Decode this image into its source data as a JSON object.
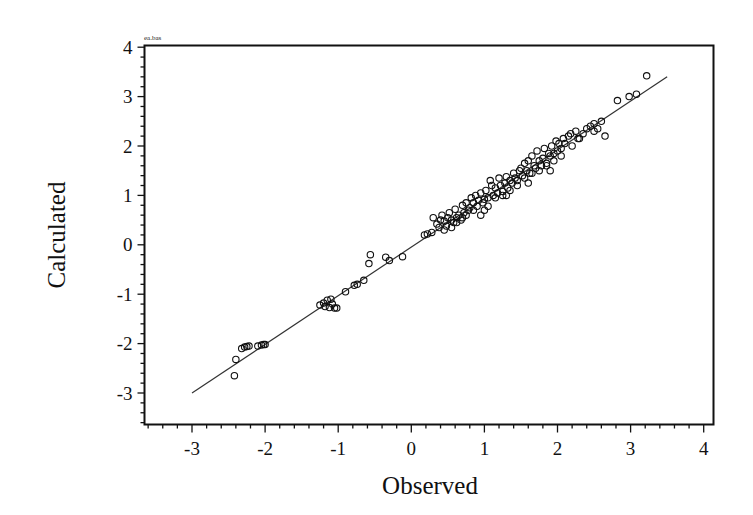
{
  "chart_data": {
    "type": "scatter",
    "title": "ea.bas",
    "xlabel": "Observed",
    "ylabel": "Calculated",
    "xlim": [
      -3.65,
      4.15
    ],
    "ylim": [
      -3.65,
      4.05
    ],
    "xticks": [
      -3,
      -2,
      -1,
      0,
      1,
      2,
      3,
      4
    ],
    "yticks": [
      -3,
      -2,
      -1,
      0,
      1,
      2,
      3,
      4
    ],
    "grid": false,
    "legend": null,
    "fit_line": {
      "x": [
        -3.0,
        3.5
      ],
      "y": [
        -3.0,
        3.4
      ]
    },
    "series": [
      {
        "name": "points",
        "marker": "open-circle",
        "x": [
          -2.42,
          -2.4,
          -2.32,
          -2.28,
          -2.25,
          -2.22,
          -2.1,
          -2.05,
          -2.02,
          -2.0,
          -1.25,
          -1.2,
          -1.18,
          -1.15,
          -1.12,
          -1.1,
          -1.08,
          -1.05,
          -1.02,
          -0.9,
          -0.78,
          -0.74,
          -0.65,
          -0.58,
          -0.56,
          -0.35,
          -0.3,
          -0.12,
          0.18,
          0.22,
          0.28,
          0.3,
          0.35,
          0.38,
          0.4,
          0.42,
          0.45,
          0.48,
          0.5,
          0.52,
          0.55,
          0.58,
          0.6,
          0.62,
          0.65,
          0.68,
          0.7,
          0.72,
          0.75,
          0.78,
          0.8,
          0.82,
          0.85,
          0.88,
          0.9,
          0.92,
          0.95,
          0.98,
          1.0,
          1.02,
          1.05,
          1.08,
          1.1,
          1.12,
          1.15,
          1.18,
          1.2,
          1.22,
          1.25,
          1.28,
          1.3,
          1.32,
          1.35,
          1.38,
          1.4,
          1.42,
          1.45,
          1.48,
          1.5,
          1.52,
          1.55,
          1.58,
          1.6,
          1.62,
          1.65,
          1.68,
          1.7,
          1.72,
          1.75,
          1.78,
          1.8,
          1.82,
          1.85,
          1.88,
          1.9,
          1.92,
          1.95,
          1.98,
          2.0,
          2.02,
          2.05,
          2.08,
          2.1,
          2.15,
          2.2,
          2.25,
          2.3,
          2.35,
          2.4,
          2.45,
          2.5,
          2.55,
          2.6,
          2.65,
          2.82,
          2.98,
          3.08,
          3.22,
          0.55,
          0.62,
          0.7,
          0.85,
          0.95,
          1.05,
          1.15,
          1.25,
          1.35,
          1.45,
          1.55,
          1.65,
          1.75,
          1.85,
          1.95,
          2.05,
          2.18,
          0.45,
          0.75,
          1.0,
          1.3,
          1.6,
          1.9,
          2.28,
          2.5
        ],
        "y": [
          -2.65,
          -2.32,
          -2.1,
          -2.07,
          -2.06,
          -2.05,
          -2.05,
          -2.03,
          -2.02,
          -2.02,
          -1.22,
          -1.18,
          -1.25,
          -1.12,
          -1.27,
          -1.1,
          -1.2,
          -1.28,
          -1.28,
          -0.95,
          -0.82,
          -0.8,
          -0.72,
          -0.38,
          -0.2,
          -0.25,
          -0.32,
          -0.24,
          0.2,
          0.22,
          0.25,
          0.55,
          0.42,
          0.35,
          0.5,
          0.6,
          0.48,
          0.38,
          0.55,
          0.65,
          0.5,
          0.45,
          0.72,
          0.55,
          0.6,
          0.5,
          0.8,
          0.65,
          0.85,
          0.7,
          0.75,
          0.95,
          0.85,
          1.0,
          0.78,
          0.9,
          1.05,
          0.85,
          0.92,
          1.1,
          0.95,
          1.3,
          1.2,
          1.0,
          1.15,
          1.05,
          1.35,
          1.2,
          1.08,
          1.25,
          1.38,
          1.15,
          1.3,
          1.25,
          1.45,
          1.35,
          1.2,
          1.5,
          1.55,
          1.4,
          1.65,
          1.5,
          1.7,
          1.45,
          1.8,
          1.6,
          1.55,
          1.9,
          1.7,
          1.6,
          1.75,
          1.95,
          1.65,
          1.85,
          1.8,
          2.0,
          1.85,
          2.1,
          1.9,
          2.05,
          1.95,
          2.15,
          2.05,
          2.2,
          2.0,
          2.3,
          2.15,
          2.25,
          2.35,
          2.4,
          2.45,
          2.35,
          2.5,
          2.2,
          2.92,
          3.0,
          3.05,
          3.42,
          0.35,
          0.45,
          0.55,
          0.7,
          0.6,
          0.78,
          0.95,
          1.0,
          1.1,
          1.3,
          1.35,
          1.45,
          1.5,
          1.6,
          1.7,
          1.8,
          2.25,
          0.3,
          0.6,
          0.7,
          1.0,
          1.25,
          1.5,
          2.15,
          2.3
        ]
      }
    ]
  }
}
